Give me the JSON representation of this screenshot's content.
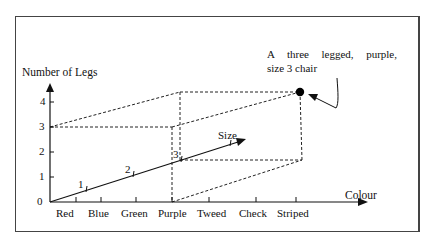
{
  "diagram": {
    "y_axis": {
      "label": "Number of Legs",
      "ticks": [
        "0",
        "1",
        "2",
        "3",
        "4"
      ]
    },
    "x_axis": {
      "label": "Colour",
      "ticks": [
        "Red",
        "Blue",
        "Green",
        "Purple",
        "Tweed",
        "Check",
        "Striped"
      ]
    },
    "z_axis": {
      "label": "Size",
      "ticks": [
        "1",
        "2",
        "3"
      ]
    },
    "point": {
      "legs": 3,
      "colour": "Purple",
      "size": 3
    },
    "annotation": {
      "line1": "A three legged, purple,",
      "line2": "size 3 chair"
    },
    "colors": {
      "ink": "#111111",
      "background": "#ffffff"
    }
  }
}
